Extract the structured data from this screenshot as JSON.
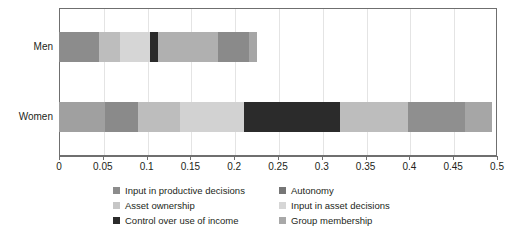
{
  "chart_data": {
    "type": "bar",
    "orientation": "horizontal",
    "stacked": true,
    "title": "",
    "subtitle": "",
    "xlabel": "",
    "ylabel": "",
    "xlim": [
      0,
      0.5
    ],
    "grid": true,
    "legend_position": "bottom",
    "categories": [
      "Men",
      "Women"
    ],
    "tick_labels": [
      "0",
      "0.05",
      "0.1",
      "0.15",
      "0.2",
      "0.25",
      "0.3",
      "0.35",
      "0.4",
      "0.45",
      "0.5"
    ],
    "tick_values": [
      0,
      0.05,
      0.1,
      0.15,
      0.2,
      0.25,
      0.3,
      0.35,
      0.4,
      0.45,
      0.5
    ],
    "series": [
      {
        "name": "Input in productive decisions",
        "color": "#8c8c8c",
        "values": [
          0.046,
          0.053
        ]
      },
      {
        "name": "Autonomy",
        "color": "#767676",
        "values": [
          0.024,
          0.037
        ]
      },
      {
        "name": "Asset ownership",
        "color": "#b4b4b4",
        "values": [
          0.034,
          0.048
        ]
      },
      {
        "name": "Input in asset decisions",
        "color": "#d2d2d2",
        "values": [
          0.009,
          0.073
        ]
      },
      {
        "name": "Control over use of income",
        "color": "#2b2b2b",
        "values": [
          0.009,
          0.11
        ]
      },
      {
        "name": "Group membership",
        "color": "#a8a8a8",
        "values": [
          0.104,
          0.173
        ]
      }
    ],
    "segments": {
      "Men": [
        {
          "series": "Input in productive decisions",
          "color": "#8c8c8c",
          "start": 0.0,
          "end": 0.046,
          "width": 0.046
        },
        {
          "series": "Autonomy",
          "color": "#bdbdbd",
          "start": 0.046,
          "end": 0.07,
          "width": 0.024
        },
        {
          "series": "Asset ownership",
          "color": "#d6d6d6",
          "start": 0.07,
          "end": 0.104,
          "width": 0.034
        },
        {
          "series": "Control over use of income",
          "color": "#2b2b2b",
          "start": 0.104,
          "end": 0.113,
          "width": 0.009
        },
        {
          "series": "Input in asset decisions",
          "color": "#b0b0b0",
          "start": 0.113,
          "end": 0.181,
          "width": 0.068
        },
        {
          "series": "Group membership",
          "color": "#8a8a8a",
          "start": 0.181,
          "end": 0.217,
          "width": 0.036
        },
        {
          "series": "Group membership",
          "color": "#a6a6a6",
          "start": 0.217,
          "end": 0.226,
          "width": 0.009
        }
      ],
      "Women": [
        {
          "series": "Input in productive decisions",
          "color": "#a0a0a0",
          "start": 0.0,
          "end": 0.053,
          "width": 0.053
        },
        {
          "series": "Autonomy",
          "color": "#8a8a8a",
          "start": 0.053,
          "end": 0.09,
          "width": 0.037
        },
        {
          "series": "Asset ownership",
          "color": "#bdbdbd",
          "start": 0.09,
          "end": 0.138,
          "width": 0.048
        },
        {
          "series": "Input in asset decisions",
          "color": "#d2d2d2",
          "start": 0.138,
          "end": 0.211,
          "width": 0.073
        },
        {
          "series": "Control over use of income",
          "color": "#2b2b2b",
          "start": 0.211,
          "end": 0.321,
          "width": 0.11
        },
        {
          "series": "Group membership",
          "color": "#bdbdbd",
          "start": 0.321,
          "end": 0.399,
          "width": 0.078
        },
        {
          "series": "Group membership",
          "color": "#8f8f8f",
          "start": 0.399,
          "end": 0.463,
          "width": 0.064
        },
        {
          "series": "Group membership",
          "color": "#a6a6a6",
          "start": 0.463,
          "end": 0.494,
          "width": 0.031
        }
      ]
    },
    "totals": {
      "Men": 0.226,
      "Women": 0.494
    },
    "legend": [
      {
        "label": "Input in productive decisions",
        "color": "#8c8c8c"
      },
      {
        "label": "Autonomy",
        "color": "#767676"
      },
      {
        "label": "Asset ownership",
        "color": "#c6c6c6"
      },
      {
        "label": "Input in asset decisions",
        "color": "#d6d6d6"
      },
      {
        "label": "Control over use of income",
        "color": "#2b2b2b"
      },
      {
        "label": "Group membership",
        "color": "#a8a8a8"
      }
    ]
  }
}
